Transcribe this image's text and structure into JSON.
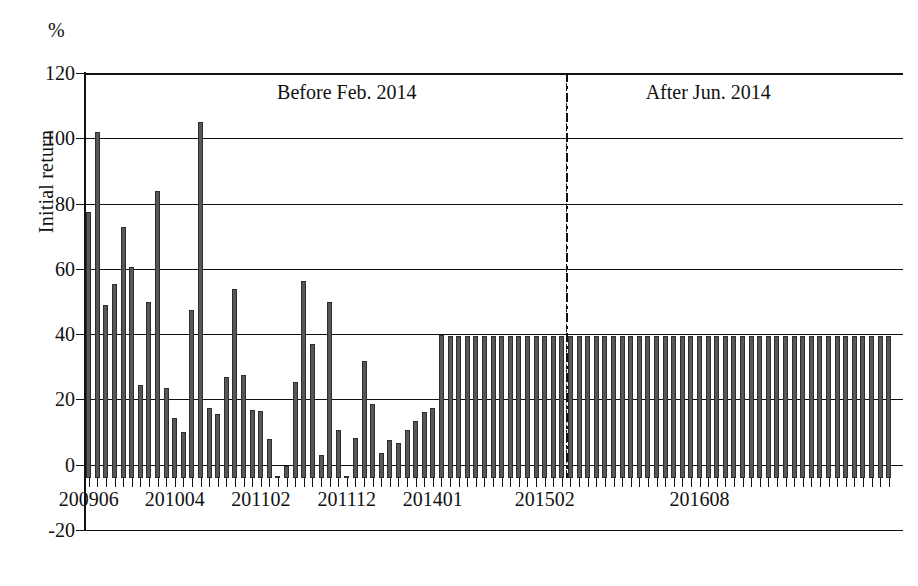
{
  "axis_unit_label": "%",
  "ylabel": "Initial return",
  "annotations": [
    {
      "name": "before-period",
      "text": "Before Feb. 2014",
      "x_value": "201112"
    },
    {
      "name": "after-period",
      "text": "After Jun. 2014",
      "x_value": "201506"
    }
  ],
  "divider": {
    "label": "regulation-divider",
    "x_value": "201402",
    "style": "dash-dot"
  },
  "chart_data": {
    "type": "bar",
    "title": "",
    "subtitle": "",
    "xlabel": "",
    "ylabel": "Initial return",
    "unit": "%",
    "ylim": [
      -20,
      120
    ],
    "yticks": [
      -20,
      0,
      20,
      40,
      60,
      80,
      100,
      120
    ],
    "ytick_labels": [
      "-20",
      "0",
      "20",
      "40",
      "60",
      "80",
      "100",
      "120"
    ],
    "gridlines": [
      0,
      20,
      40,
      60,
      80,
      100,
      120
    ],
    "grid": true,
    "legend": null,
    "xtick_labels": [
      "200906",
      "201004",
      "201102",
      "201112",
      "201401",
      "201502",
      "201608"
    ],
    "xtick_indices": [
      0,
      10,
      20,
      30,
      40,
      53,
      71
    ],
    "bar_color": "#575757",
    "categories": [
      "200906",
      "200907",
      "200908",
      "200909",
      "200910",
      "200911",
      "200912",
      "201001",
      "201002",
      "201003",
      "201004",
      "201005",
      "201006",
      "201007",
      "201008",
      "201009",
      "201010",
      "201011",
      "201012",
      "201101",
      "201102",
      "201103",
      "201104",
      "201105",
      "201106",
      "201107",
      "201108",
      "201109",
      "201110",
      "201111",
      "201112",
      "201201",
      "201202",
      "201203",
      "201204",
      "201205",
      "201206",
      "201207",
      "201208",
      "201209",
      "201210",
      "201211",
      "201212",
      "201301",
      "201302",
      "201303",
      "201304",
      "201305",
      "201306",
      "201307",
      "201308",
      "201309",
      "201310",
      "201311",
      "201312",
      "201401",
      "201402",
      "201403",
      "201404",
      "201405",
      "201406",
      "201407",
      "201408",
      "201409",
      "201410",
      "201411",
      "201412",
      "201501",
      "201502",
      "201503",
      "201504",
      "201505",
      "201506",
      "201507",
      "201508",
      "201509",
      "201510",
      "201511",
      "201512",
      "201601",
      "201602",
      "201603",
      "201604",
      "201605",
      "201606",
      "201607",
      "201608",
      "201609",
      "201610",
      "201611",
      "201612",
      "201701",
      "201702",
      "201703"
    ],
    "values": [
      81.5,
      106.0,
      53.0,
      59.5,
      77.0,
      64.5,
      28.5,
      54.0,
      88.0,
      27.5,
      18.5,
      14.0,
      51.5,
      109.0,
      21.5,
      19.5,
      31.0,
      58.0,
      31.5,
      20.8,
      20.5,
      11.8,
      0.0,
      3.8,
      29.5,
      60.5,
      41.0,
      7.0,
      54.0,
      14.8,
      0.4,
      12.3,
      35.8,
      22.8,
      7.8,
      11.5,
      10.8,
      14.8,
      17.5,
      20.2,
      21.3,
      43.8,
      43.5,
      43.5,
      43.5,
      43.5,
      43.5,
      43.5,
      43.5,
      43.5,
      43.5,
      43.5,
      43.5,
      43.5,
      43.5,
      43.5,
      43.5,
      43.5,
      43.5,
      43.5,
      43.5,
      43.5,
      43.5,
      43.5,
      43.5,
      43.5,
      43.5,
      43.5,
      43.5,
      43.5,
      43.5,
      43.5,
      43.5,
      43.5,
      43.5,
      43.5,
      43.5,
      43.5,
      43.5,
      43.5,
      43.5,
      43.5,
      43.5,
      43.5,
      43.5,
      43.5,
      43.5,
      43.5,
      43.5,
      43.5,
      43.5,
      43.5,
      43.5,
      43.5
    ]
  }
}
